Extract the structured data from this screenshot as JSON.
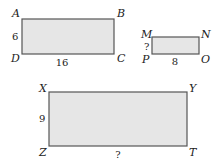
{
  "diagram": {
    "fill_color": "#e6e6e6",
    "stroke_color": "#555555",
    "rectangles": [
      {
        "name": "ABCD",
        "vertices": {
          "top_left": "A",
          "top_right": "B",
          "bottom_right": "C",
          "bottom_left": "D"
        },
        "height_label": "6",
        "width_label": "16"
      },
      {
        "name": "MNOP",
        "vertices": {
          "top_left": "M",
          "top_right": "N",
          "bottom_right": "O",
          "bottom_left": "P"
        },
        "height_label": "?",
        "width_label": "8"
      },
      {
        "name": "XYTZ",
        "vertices": {
          "top_left": "X",
          "top_right": "Y",
          "bottom_right": "T",
          "bottom_left": "Z"
        },
        "height_label": "9",
        "width_label": "?"
      }
    ]
  }
}
